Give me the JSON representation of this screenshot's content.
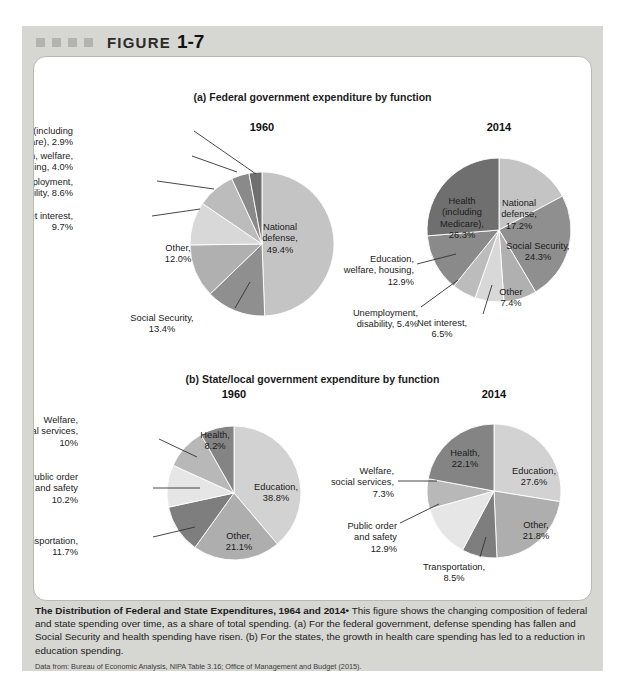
{
  "figure": {
    "label_word": "FIGURE",
    "label_number": "1-7",
    "marker_count": 4
  },
  "panels": [
    {
      "id": "panel-a",
      "title": "(a) Federal government expenditure by function",
      "charts": [
        "federal-1960",
        "federal-2014"
      ]
    },
    {
      "id": "panel-b",
      "title": "(b) State/local government expenditure by function",
      "charts": [
        "state-1960",
        "state-2014"
      ]
    }
  ],
  "caption": {
    "headline": "The Distribution of Federal and State Expenditures, 1964 and 2014",
    "bullet": "•",
    "body": "This figure shows the changing composition of federal and state spending over time, as a share of total spending. (a) For the federal government, defense spending has fallen and Social Security and health spending have risen. (b) For the states, the growth in health care spending has led to a reduction in education spending.",
    "source": "Data from: Bureau of Economic Analysis, NIPA Table 3.16; Office of Management and Budget (2015)."
  },
  "colors": {
    "frame": "#d6d6d2",
    "card": "#ffffff",
    "marker": "#b4b4ae",
    "text": "#1b1b1b",
    "leader": "#333333",
    "slice_light": "#c9c9c9",
    "slice_mid": "#9e9e9e",
    "slice_dark": "#6e6e6e",
    "slice_pale": "#e4e4e4"
  },
  "chart_data": [
    {
      "id": "federal-1960",
      "type": "pie",
      "title": "1960",
      "panel": "(a) Federal government expenditure by function",
      "start_angle": 0,
      "categories": [
        "National defense",
        "Social Security",
        "Other",
        "Net interest",
        "Unemployment, disability",
        "Education, welfare, housing",
        "Health (including Medicare)"
      ],
      "values": [
        49.4,
        13.4,
        12.0,
        9.7,
        8.6,
        4.0,
        2.9
      ],
      "value_labels": [
        "49.4%",
        "13.4%",
        "12.0%",
        "9.7%",
        "8.6%",
        "4.0%",
        "2.9%"
      ],
      "slice_colors": [
        "#c4c4c4",
        "#8f8f8f",
        "#b0b0b0",
        "#d8d8d8",
        "#bcbcbc",
        "#8a8a8a",
        "#6f6f6f"
      ],
      "labels": [
        {
          "key": "national-defense",
          "lines": [
            "National",
            "defense,",
            "49.4%"
          ],
          "inside": true,
          "align": "c",
          "x": 258,
          "y": 196
        },
        {
          "key": "social-security",
          "lines": [
            "Social Security,",
            "13.4%"
          ],
          "inside": false,
          "align": "c",
          "x": 140,
          "y": 287,
          "leader": [
            [
              213,
              282
            ],
            [
              228,
              256
            ]
          ]
        },
        {
          "key": "other",
          "lines": [
            "Other,",
            "12.0%"
          ],
          "inside": true,
          "align": "c",
          "x": 156,
          "y": 217
        },
        {
          "key": "net-interest",
          "lines": [
            "Net interest,",
            "9.7%"
          ],
          "inside": false,
          "align": "r",
          "x": 51,
          "y": 185,
          "leader": [
            [
              130,
              190
            ],
            [
              178,
              183
            ]
          ]
        },
        {
          "key": "unemployment-disability",
          "lines": [
            "Unemployment,",
            "disability, 8.6%"
          ],
          "inside": false,
          "align": "r",
          "x": 51,
          "y": 151,
          "leader": [
            [
              135,
              155
            ],
            [
              192,
              163
            ]
          ]
        },
        {
          "key": "education-welfare-housing",
          "lines": [
            "Education, welfare,",
            "housing, 4.0%"
          ],
          "inside": false,
          "align": "r",
          "x": 51,
          "y": 125,
          "leader": [
            [
              170,
              130
            ],
            [
              215,
              146
            ]
          ]
        },
        {
          "key": "health-medicare",
          "lines": [
            "Health (including",
            "Medicare), 2.9%"
          ],
          "inside": false,
          "align": "r",
          "x": 51,
          "y": 100,
          "leader": [
            [
              172,
              105
            ],
            [
              234,
              148
            ]
          ]
        }
      ]
    },
    {
      "id": "federal-2014",
      "type": "pie",
      "title": "2014",
      "panel": "(a) Federal government expenditure by function",
      "start_angle": 0,
      "categories": [
        "National defense",
        "Social Security",
        "Other",
        "Net interest",
        "Unemployment, disability",
        "Education, welfare, housing",
        "Health (including Medicare)"
      ],
      "values": [
        17.2,
        24.3,
        7.4,
        6.5,
        5.4,
        12.9,
        26.3
      ],
      "value_labels": [
        "17.2%",
        "24.3%",
        "7.4%",
        "6.5%",
        "5.4%",
        "12.9%",
        "26.3%"
      ],
      "slice_colors": [
        "#c4c4c4",
        "#8f8f8f",
        "#b0b0b0",
        "#d8d8d8",
        "#bcbcbc",
        "#8a8a8a",
        "#6f6f6f"
      ],
      "labels": [
        {
          "key": "national-defense",
          "lines": [
            "National",
            "defense,",
            "17.2%"
          ],
          "inside": true,
          "align": "c",
          "x": 497,
          "y": 172
        },
        {
          "key": "social-security",
          "lines": [
            "Social Security,",
            "24.3%"
          ],
          "inside": true,
          "align": "c",
          "x": 516,
          "y": 215
        },
        {
          "key": "other",
          "lines": [
            "Other",
            "7.4%"
          ],
          "inside": true,
          "align": "c",
          "x": 489,
          "y": 261
        },
        {
          "key": "net-interest",
          "lines": [
            "Net interest,",
            "6.5%"
          ],
          "inside": false,
          "align": "c",
          "x": 420,
          "y": 292,
          "leader": [
            [
              461,
              288
            ],
            [
              470,
              259
            ]
          ]
        },
        {
          "key": "unemployment-disability",
          "lines": [
            "Unemployment,",
            "disability, 5.4%"
          ],
          "inside": false,
          "align": "r",
          "x": 396,
          "y": 282,
          "leader": [
            [
              399,
              281
            ],
            [
              436,
              254
            ]
          ]
        },
        {
          "key": "education-welfare-housing",
          "lines": [
            "Education,",
            "welfare, housing,",
            "12.9%"
          ],
          "inside": false,
          "align": "r",
          "x": 392,
          "y": 228,
          "leader": [
            [
              395,
              238
            ],
            [
              434,
              228
            ]
          ]
        },
        {
          "key": "health-medicare",
          "lines": [
            "Health",
            "(including",
            "Medicare),",
            "26.3%"
          ],
          "inside": true,
          "align": "c",
          "x": 440,
          "y": 170
        }
      ]
    },
    {
      "id": "state-1960",
      "type": "pie",
      "title": "1960",
      "panel": "(b) State/local government expenditure by function",
      "start_angle": 0,
      "categories": [
        "Education",
        "Other",
        "Transportation",
        "Public order and safety",
        "Welfare, social services",
        "Health"
      ],
      "values": [
        38.8,
        21.1,
        11.7,
        10.2,
        10.0,
        8.2
      ],
      "value_labels": [
        "38.8%",
        "21.1%",
        "11.7%",
        "10.2%",
        "10%",
        "8.2%"
      ],
      "slice_colors": [
        "#d2d2d2",
        "#aeaeae",
        "#7e7e7e",
        "#e6e6e6",
        "#b8b8b8",
        "#848484"
      ],
      "labels": [
        {
          "key": "education",
          "lines": [
            "Education,",
            "38.8%"
          ],
          "inside": true,
          "align": "c",
          "x": 254,
          "y": 456
        },
        {
          "key": "other",
          "lines": [
            "Other,",
            "21.1%"
          ],
          "inside": true,
          "align": "c",
          "x": 217,
          "y": 505
        },
        {
          "key": "transportation",
          "lines": [
            "Transportation,",
            "11.7%"
          ],
          "inside": false,
          "align": "r",
          "x": 56,
          "y": 510,
          "leader": [
            [
              131,
              511
            ],
            [
              173,
              501
            ]
          ]
        },
        {
          "key": "public-order-safety",
          "lines": [
            "Public order",
            "and safety",
            "10.2%"
          ],
          "inside": false,
          "align": "r",
          "x": 56,
          "y": 446,
          "leader": [
            [
              131,
              462
            ],
            [
              178,
              462
            ]
          ]
        },
        {
          "key": "welfare-social-services",
          "lines": [
            "Welfare,",
            "social services,",
            "10%"
          ],
          "inside": false,
          "align": "r",
          "x": 56,
          "y": 389,
          "leader": [
            [
              137,
              413
            ],
            [
              175,
              431
            ]
          ]
        },
        {
          "key": "health",
          "lines": [
            "Health,",
            "8.2%"
          ],
          "inside": true,
          "align": "c",
          "x": 193,
          "y": 404
        }
      ]
    },
    {
      "id": "state-2014",
      "type": "pie",
      "title": "2014",
      "panel": "(b) State/local government expenditure by function",
      "start_angle": 0,
      "categories": [
        "Education",
        "Other",
        "Transportation",
        "Public order and safety",
        "Welfare, social services",
        "Health"
      ],
      "values": [
        27.6,
        21.8,
        8.5,
        12.9,
        7.3,
        22.1
      ],
      "value_labels": [
        "27.6%",
        "21.8%",
        "8.5%",
        "12.9%",
        "7.3%",
        "22.1%"
      ],
      "slice_colors": [
        "#d2d2d2",
        "#aeaeae",
        "#7e7e7e",
        "#e6e6e6",
        "#b8b8b8",
        "#848484"
      ],
      "labels": [
        {
          "key": "education",
          "lines": [
            "Education,",
            "27.6%"
          ],
          "inside": true,
          "align": "c",
          "x": 512,
          "y": 440
        },
        {
          "key": "other",
          "lines": [
            "Other,",
            "21.8%"
          ],
          "inside": true,
          "align": "c",
          "x": 514,
          "y": 494
        },
        {
          "key": "transportation",
          "lines": [
            "Transportation,",
            "8.5%"
          ],
          "inside": false,
          "align": "c",
          "x": 432,
          "y": 536,
          "leader": [
            [
              458,
              531
            ],
            [
              464,
              511
            ]
          ]
        },
        {
          "key": "public-order-safety",
          "lines": [
            "Public order",
            "and safety",
            "12.9%"
          ],
          "inside": false,
          "align": "r",
          "x": 375,
          "y": 495,
          "leader": [
            [
              378,
              497
            ],
            [
              417,
              478
            ]
          ]
        },
        {
          "key": "welfare-social-services",
          "lines": [
            "Welfare,",
            "social services,",
            "7.3%"
          ],
          "inside": false,
          "align": "r",
          "x": 372,
          "y": 440,
          "leader": [
            [
              376,
              455
            ],
            [
              415,
              455
            ]
          ]
        },
        {
          "key": "health",
          "lines": [
            "Health,",
            "22.1%"
          ],
          "inside": true,
          "align": "c",
          "x": 443,
          "y": 422
        }
      ]
    }
  ],
  "geometry": {
    "federal-1960": {
      "cx": 240,
      "cy": 218,
      "r": 72,
      "title_x": 240,
      "title_y": 95
    },
    "federal-2014": {
      "cx": 477,
      "cy": 204,
      "r": 72,
      "title_x": 477,
      "title_y": 95
    },
    "state-1960": {
      "cx": 212,
      "cy": 467,
      "r": 67,
      "title_x": 212,
      "title_y": 362
    },
    "state-2014": {
      "cx": 472,
      "cy": 465,
      "r": 67,
      "title_x": 472,
      "title_y": 362
    }
  }
}
